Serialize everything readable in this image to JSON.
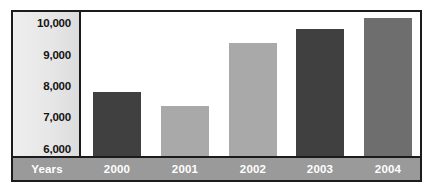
{
  "chart_data": {
    "type": "bar",
    "title": "",
    "xlabel": "Years",
    "ylabel": "",
    "categories": [
      "2000",
      "2001",
      "2002",
      "2003",
      "2004"
    ],
    "values": [
      7800,
      7380,
      9380,
      9800,
      10150
    ],
    "ylim": [
      5650,
      10350
    ],
    "yticks": [
      6000,
      7000,
      8000,
      9000,
      10000
    ],
    "ytick_labels": [
      "6,000",
      "7,000",
      "8,000",
      "9,000",
      "10,000"
    ],
    "grid": false,
    "legend": null,
    "bar_colors": [
      "#404040",
      "#a9a9a9",
      "#a9a9a9",
      "#404040",
      "#6e6e6e"
    ]
  },
  "axis": {
    "years_label": "Years"
  },
  "colors": {
    "frame": "#1b1b1b",
    "panel": "#e6e6e6",
    "band": "#9a9a9a",
    "band_text": "#ffffff",
    "bar_dark": "#404040",
    "bar_light": "#a9a9a9",
    "bar_mid": "#6e6e6e",
    "plot_bg": "#ffffff"
  }
}
